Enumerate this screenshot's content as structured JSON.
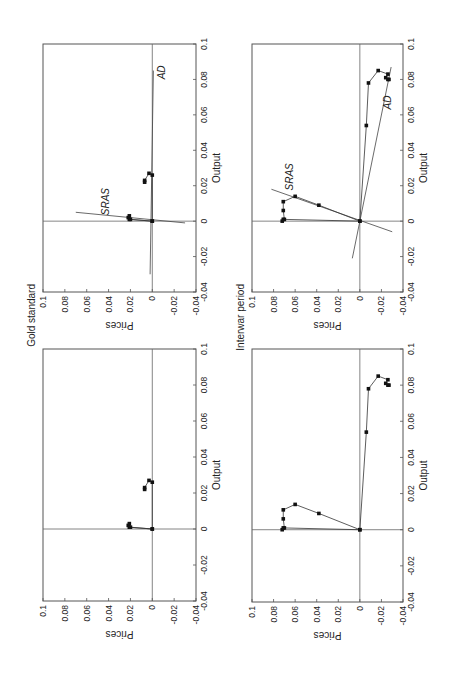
{
  "figure": {
    "rotation_deg": -90,
    "panel_titles": [
      "Gold standard",
      "Interwar period"
    ]
  },
  "chart_data": [
    {
      "type": "scatter",
      "title": "Gold standard",
      "panel": "with-curves",
      "xlabel": "Output",
      "ylabel": "Prices",
      "xlim": [
        -0.04,
        0.1
      ],
      "ylim": [
        -0.04,
        0.1
      ],
      "xticks": [
        "-0.04",
        "-0.02",
        "0",
        "0.02",
        "0.04",
        "0.06",
        "0.08",
        "0.1"
      ],
      "yticks": [
        "-0.04",
        "-0.02",
        "0",
        "0.02",
        "0.04",
        "0.06",
        "0.08",
        "0.1"
      ],
      "grid": false,
      "zero_lines": true,
      "path": [
        [
          0.0,
          0.0
        ],
        [
          0.001,
          0.021
        ],
        [
          0.002,
          0.022
        ],
        [
          0.003,
          0.021
        ],
        [
          0.001,
          0.02
        ],
        [
          0.0,
          0.0
        ],
        [
          0.026,
          0.0
        ],
        [
          0.027,
          0.003
        ],
        [
          0.023,
          0.007
        ],
        [
          0.022,
          0.007
        ]
      ],
      "lines": [
        {
          "name": "SRAS",
          "from": [
            0.005,
            0.07
          ],
          "to": [
            -0.001,
            -0.03
          ],
          "label_at": [
            0.011,
            0.04
          ]
        },
        {
          "name": "AD",
          "from": [
            0.085,
            -0.001
          ],
          "to": [
            -0.03,
            0.002
          ],
          "label_at": [
            0.084,
            -0.012
          ]
        }
      ]
    },
    {
      "type": "scatter",
      "title": "Interwar period",
      "panel": "with-curves",
      "xlabel": "Output",
      "ylabel": "Prices",
      "xlim": [
        -0.04,
        0.1
      ],
      "ylim": [
        -0.04,
        0.1
      ],
      "xticks": [
        "-0.04",
        "-0.02",
        "0",
        "0.02",
        "0.04",
        "0.06",
        "0.08",
        "0.1"
      ],
      "yticks": [
        "-0.04",
        "-0.02",
        "0",
        "0.02",
        "0.04",
        "0.06",
        "0.08",
        "0.1"
      ],
      "grid": false,
      "zero_lines": true,
      "path": [
        [
          0.0,
          0.0
        ],
        [
          0.009,
          0.038
        ],
        [
          0.014,
          0.06
        ],
        [
          0.011,
          0.071
        ],
        [
          0.006,
          0.071
        ],
        [
          0.001,
          0.07
        ],
        [
          0.0,
          0.072
        ],
        [
          0.001,
          0.071
        ],
        [
          0.0,
          0.0
        ],
        [
          0.054,
          -0.006
        ],
        [
          0.078,
          -0.008
        ],
        [
          0.085,
          -0.017
        ],
        [
          0.083,
          -0.026
        ],
        [
          0.081,
          -0.024
        ],
        [
          0.08,
          -0.026
        ],
        [
          0.08,
          -0.027
        ]
      ],
      "lines": [
        {
          "name": "SRAS",
          "from": [
            0.018,
            0.082
          ],
          "to": [
            -0.006,
            -0.03
          ],
          "label_at": [
            0.025,
            0.062
          ]
        },
        {
          "name": "AD",
          "from": [
            -0.021,
            0.007
          ],
          "to": [
            0.087,
            -0.029
          ],
          "label_at": [
            0.067,
            -0.029
          ]
        }
      ]
    },
    {
      "type": "scatter",
      "title": "Gold standard",
      "panel": "points-only",
      "xlabel": "Output",
      "ylabel": "Prices",
      "xlim": [
        -0.04,
        0.1
      ],
      "ylim": [
        -0.04,
        0.1
      ],
      "xticks": [
        "-0.04",
        "-0.02",
        "0",
        "0.02",
        "0.04",
        "0.06",
        "0.08",
        "0.1"
      ],
      "yticks": [
        "-0.04",
        "-0.02",
        "0",
        "0.02",
        "0.04",
        "0.06",
        "0.08",
        "0.1"
      ],
      "grid": false,
      "zero_lines": true,
      "path": [
        [
          0.0,
          0.0
        ],
        [
          0.001,
          0.021
        ],
        [
          0.002,
          0.022
        ],
        [
          0.003,
          0.021
        ],
        [
          0.001,
          0.02
        ],
        [
          0.0,
          0.0
        ],
        [
          0.026,
          0.0
        ],
        [
          0.027,
          0.003
        ],
        [
          0.023,
          0.007
        ],
        [
          0.022,
          0.007
        ]
      ],
      "lines": []
    },
    {
      "type": "scatter",
      "title": "Interwar period",
      "panel": "points-only",
      "xlabel": "Output",
      "ylabel": "Prices",
      "xlim": [
        -0.04,
        0.1
      ],
      "ylim": [
        -0.04,
        0.1
      ],
      "xticks": [
        "-0.04",
        "-0.02",
        "0",
        "0.02",
        "0.04",
        "0.06",
        "0.08",
        "0.1"
      ],
      "yticks": [
        "-0.04",
        "-0.02",
        "0",
        "0.02",
        "0.04",
        "0.06",
        "0.08",
        "0.1"
      ],
      "grid": false,
      "zero_lines": true,
      "path": [
        [
          0.0,
          0.0
        ],
        [
          0.009,
          0.038
        ],
        [
          0.014,
          0.06
        ],
        [
          0.011,
          0.071
        ],
        [
          0.006,
          0.071
        ],
        [
          0.001,
          0.07
        ],
        [
          0.0,
          0.072
        ],
        [
          0.001,
          0.071
        ],
        [
          0.0,
          0.0
        ],
        [
          0.054,
          -0.006
        ],
        [
          0.078,
          -0.008
        ],
        [
          0.085,
          -0.017
        ],
        [
          0.083,
          -0.026
        ],
        [
          0.081,
          -0.024
        ],
        [
          0.08,
          -0.026
        ],
        [
          0.08,
          -0.027
        ]
      ],
      "lines": []
    }
  ],
  "layout": {
    "panels": [
      {
        "left": 43,
        "top": 44,
        "width": 153,
        "height": 248,
        "title_index": 0
      },
      {
        "left": 252,
        "top": 44,
        "width": 151,
        "height": 248,
        "title_index": 1
      },
      {
        "left": 43,
        "top": 349,
        "width": 153,
        "height": 252,
        "title_index": null
      },
      {
        "left": 252,
        "top": 349,
        "width": 151,
        "height": 253,
        "title_index": null
      }
    ]
  }
}
